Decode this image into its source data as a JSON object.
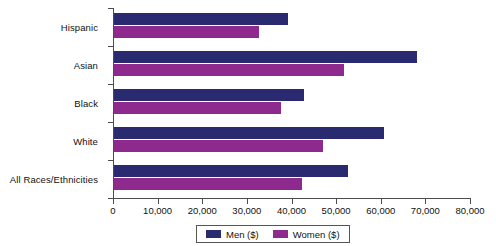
{
  "chart_data": {
    "type": "bar",
    "orientation": "horizontal",
    "title": "",
    "xlabel": "",
    "ylabel": "",
    "xlim": [
      0,
      80000
    ],
    "xticks": [
      0,
      10000,
      20000,
      30000,
      40000,
      50000,
      60000,
      70000,
      80000
    ],
    "xtick_labels": [
      "0",
      "10,000",
      "20,000",
      "30,000",
      "40,000",
      "50,000",
      "60,000",
      "70,000",
      "80,000"
    ],
    "grid": false,
    "legend_position": "bottom",
    "categories": [
      "Hispanic",
      "Asian",
      "Black",
      "White",
      "All Races/Ethnicities"
    ],
    "series": [
      {
        "name": "Men ($)",
        "color": "#2a2a70",
        "values": [
          39000,
          68000,
          42500,
          60500,
          52500
        ]
      },
      {
        "name": "Women ($)",
        "color": "#8e2a8e",
        "values": [
          32500,
          51500,
          37500,
          46800,
          42200
        ]
      }
    ]
  },
  "legend": {
    "items": [
      {
        "label": "Men ($)",
        "color": "#2a2a70"
      },
      {
        "label": "Women ($)",
        "color": "#8e2a8e"
      }
    ]
  }
}
